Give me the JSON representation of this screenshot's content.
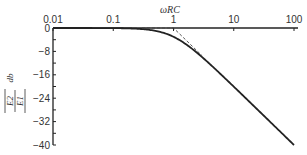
{
  "chart_data": {
    "type": "line",
    "title": "",
    "xlabel": "ωRC",
    "ylabel": "|E2/E1| db",
    "xscale": "log",
    "xlim": [
      0.01,
      100
    ],
    "ylim": [
      -40,
      0
    ],
    "x_ticks": [
      "0.01",
      "0.1",
      "1",
      "10",
      "100"
    ],
    "y_ticks": [
      "0",
      "-8",
      "-16",
      "-24",
      "-32",
      "-40"
    ],
    "grid": false,
    "legend": null,
    "series": [
      {
        "name": "exact response",
        "style": "solid",
        "x": [
          0.01,
          0.1,
          0.3,
          0.5,
          0.7,
          1,
          1.5,
          2,
          3,
          5,
          10,
          20,
          50,
          100
        ],
        "values": [
          0,
          -0.04,
          -0.37,
          -0.97,
          -1.74,
          -3.01,
          -5.12,
          -6.99,
          -10.0,
          -14.15,
          -20.04,
          -26.03,
          -33.98,
          -40.0
        ]
      },
      {
        "name": "asymptotes",
        "style": "dashed",
        "x": [
          0.3,
          1,
          3
        ],
        "values": [
          0,
          0,
          -9.54
        ]
      }
    ],
    "annotations": []
  },
  "labels": {
    "x_axis_title": "ωRC",
    "y_axis_num": "E2",
    "y_axis_den": "E1",
    "y_axis_unit": "db"
  }
}
